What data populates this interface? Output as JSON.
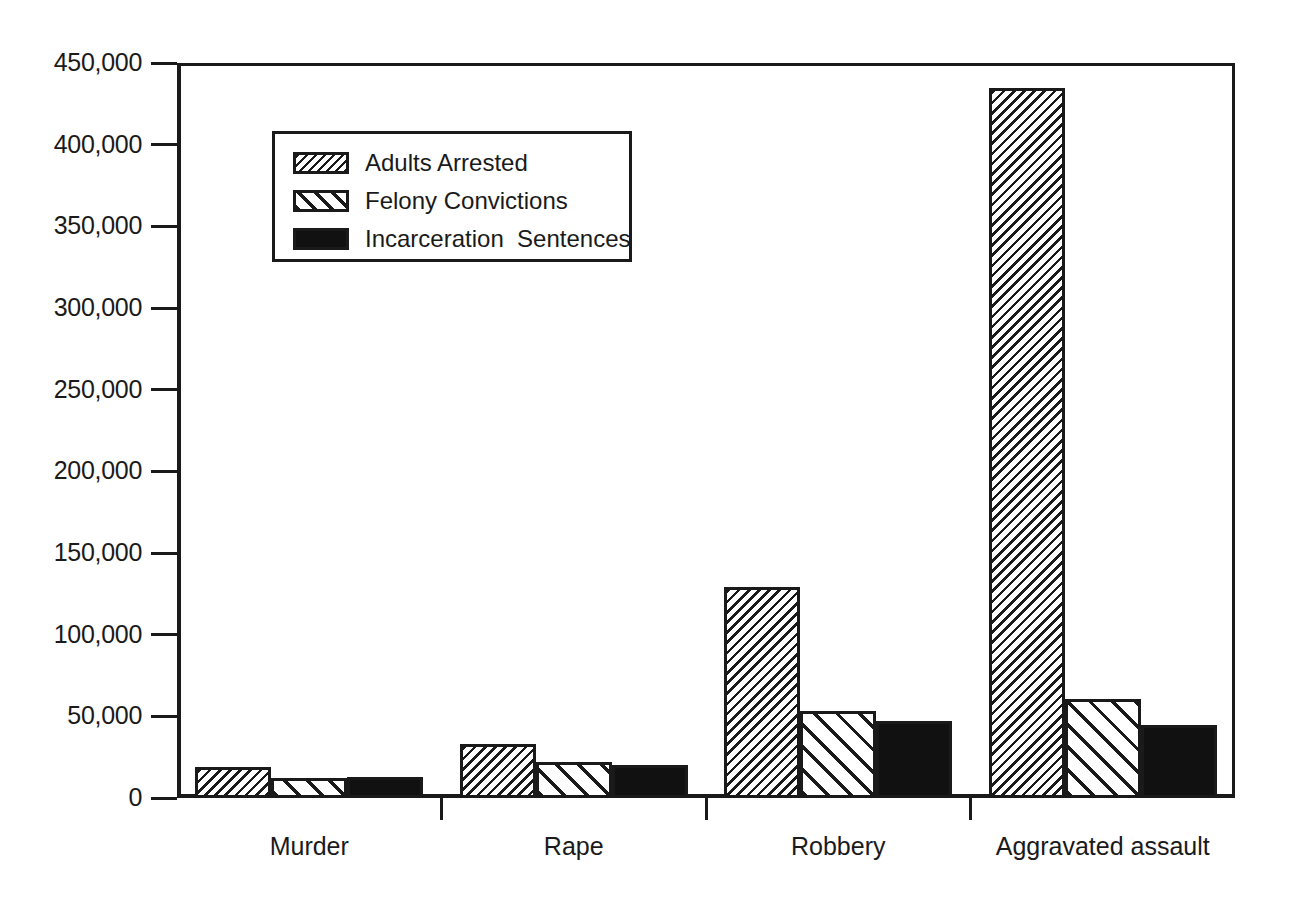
{
  "chart_data": {
    "type": "bar",
    "title": "",
    "subtitle": "",
    "xlabel": "",
    "ylabel": "",
    "ylim": [
      0,
      450000
    ],
    "ytick_values": [
      0,
      50000,
      100000,
      150000,
      200000,
      250000,
      300000,
      350000,
      400000,
      450000
    ],
    "ytick_labels": [
      "0",
      "50,000",
      "100,000",
      "150,000",
      "200,000",
      "250,000",
      "300,000",
      "350,000",
      "400,000",
      "450,000"
    ],
    "grid": false,
    "legend_position": "upper-left-inside",
    "categories": [
      "Murder",
      "Rape",
      "Robbery",
      "Aggravated assault"
    ],
    "series": [
      {
        "name": "Adults Arrested",
        "pattern": "dense-backslash-hatch",
        "color": "#1a1a1a",
        "values": [
          19000,
          33000,
          129000,
          435000
        ]
      },
      {
        "name": "Felony Convictions",
        "pattern": "sparse-forwardslash-hatch",
        "color": "#1a1a1a",
        "values": [
          12500,
          22000,
          53000,
          60500
        ]
      },
      {
        "name": "Incarceration  Sentences",
        "pattern": "solid-black",
        "color": "#111111",
        "values": [
          13000,
          20000,
          47000,
          44500
        ]
      }
    ]
  },
  "legend": {
    "entries": [
      {
        "label": "Adults Arrested"
      },
      {
        "label": "Felony Convictions"
      },
      {
        "label": "Incarceration  Sentences"
      }
    ]
  },
  "colors": {
    "ink": "#1a1a1a",
    "fill_solid": "#111111",
    "background": "#ffffff"
  }
}
